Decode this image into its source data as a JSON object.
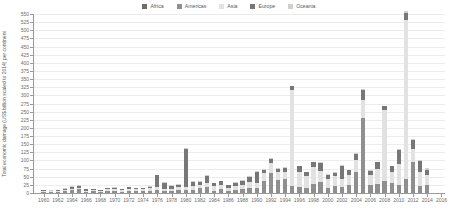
{
  "chart_data": {
    "type": "bar",
    "title": "",
    "subtitle": "",
    "xlabel": "",
    "ylabel": "Total economic damage (US$ billion scaled to 2014) per continent",
    "stacked": true,
    "grid": true,
    "legend_position": "top-center",
    "ylim": [
      0,
      550
    ],
    "ytick_step": 25,
    "ytick_labels": [
      "0",
      "25",
      "50",
      "75",
      "100",
      "125",
      "150",
      "175",
      "200",
      "225",
      "250",
      "275",
      "300",
      "325",
      "350",
      "375",
      "400",
      "425",
      "450",
      "475",
      "500",
      "525",
      "550"
    ],
    "xlim": [
      1959,
      2016
    ],
    "xtick_labels": [
      "1960",
      "1962",
      "1964",
      "1966",
      "1968",
      "1970",
      "1972",
      "1974",
      "1976",
      "1978",
      "1980",
      "1982",
      "1984",
      "1986",
      "1988",
      "1990",
      "1992",
      "1994",
      "1996",
      "1998",
      "2000",
      "2002",
      "2004",
      "2006",
      "2008",
      "2010",
      "2012",
      "2014",
      "2016"
    ],
    "categories": [
      1960,
      1961,
      1962,
      1963,
      1964,
      1965,
      1966,
      1967,
      1968,
      1969,
      1970,
      1971,
      1972,
      1973,
      1974,
      1975,
      1976,
      1977,
      1978,
      1979,
      1980,
      1981,
      1982,
      1983,
      1984,
      1985,
      1986,
      1987,
      1988,
      1989,
      1990,
      1991,
      1992,
      1993,
      1994,
      1995,
      1996,
      1997,
      1998,
      1999,
      2000,
      2001,
      2002,
      2003,
      2004,
      2005,
      2006,
      2007,
      2008,
      2009,
      2010,
      2011,
      2012,
      2013,
      2014
    ],
    "colors": {
      "Africa": "#6e6e6e",
      "Americas": "#8f8f8f",
      "Asia": "#e2e2e2",
      "Europe": "#777777",
      "Oceania": "#cfcfcf"
    },
    "series": [
      {
        "name": "Africa",
        "color": "#6e6e6e",
        "values": [
          0,
          0,
          0,
          0,
          0,
          0,
          0,
          0,
          0,
          0,
          0,
          0,
          0,
          0,
          0,
          0,
          0,
          0,
          0,
          0,
          0,
          0,
          0,
          0,
          0,
          0,
          0,
          0,
          0,
          0,
          0,
          0,
          0,
          0,
          0,
          0,
          0,
          0,
          0,
          0,
          0,
          0,
          0,
          0,
          0,
          0,
          0,
          0,
          0,
          0,
          0,
          0,
          0,
          0,
          0
        ]
      },
      {
        "name": "Americas",
        "color": "#8f8f8f",
        "values": [
          4,
          3,
          3,
          6,
          8,
          12,
          4,
          5,
          3,
          6,
          6,
          4,
          7,
          5,
          6,
          7,
          10,
          6,
          5,
          8,
          8,
          9,
          14,
          18,
          7,
          12,
          6,
          9,
          12,
          16,
          14,
          38,
          62,
          40,
          42,
          22,
          18,
          16,
          28,
          34,
          16,
          22,
          18,
          24,
          64,
          232,
          26,
          28,
          36,
          30,
          26,
          42,
          96,
          22,
          26
        ]
      },
      {
        "name": "Asia",
        "color": "#e2e2e2",
        "values": [
          2,
          2,
          3,
          4,
          5,
          4,
          3,
          4,
          3,
          5,
          6,
          5,
          6,
          6,
          5,
          8,
          10,
          6,
          8,
          10,
          12,
          14,
          10,
          12,
          14,
          12,
          10,
          14,
          12,
          18,
          16,
          22,
          30,
          24,
          24,
          296,
          48,
          36,
          52,
          34,
          26,
          30,
          26,
          32,
          38,
          54,
          28,
          46,
          218,
          36,
          62,
          490,
          40,
          44,
          28
        ]
      },
      {
        "name": "Europe",
        "color": "#777777",
        "values": [
          2,
          2,
          3,
          3,
          6,
          7,
          4,
          3,
          2,
          4,
          4,
          3,
          5,
          4,
          3,
          5,
          34,
          20,
          10,
          8,
          116,
          12,
          10,
          22,
          9,
          12,
          8,
          9,
          14,
          16,
          36,
          12,
          14,
          10,
          12,
          10,
          16,
          12,
          14,
          24,
          14,
          10,
          40,
          14,
          18,
          32,
          14,
          20,
          12,
          16,
          44,
          20,
          26,
          32,
          18
        ]
      },
      {
        "name": "Oceania",
        "color": "#cfcfcf",
        "values": [
          1,
          1,
          1,
          1,
          2,
          2,
          1,
          1,
          1,
          1,
          2,
          1,
          2,
          1,
          1,
          2,
          2,
          1,
          2,
          2,
          2,
          2,
          2,
          2,
          2,
          2,
          2,
          2,
          2,
          2,
          2,
          2,
          2,
          2,
          2,
          2,
          2,
          2,
          2,
          2,
          2,
          2,
          2,
          2,
          2,
          2,
          2,
          2,
          2,
          2,
          4,
          8,
          4,
          4,
          4
        ]
      }
    ]
  },
  "legend": {
    "items": [
      {
        "label": "Africa",
        "color": "#6e6e6e"
      },
      {
        "label": "Americas",
        "color": "#8f8f8f"
      },
      {
        "label": "Asia",
        "color": "#e2e2e2"
      },
      {
        "label": "Europe",
        "color": "#777777"
      },
      {
        "label": "Oceania",
        "color": "#cfcfcf"
      }
    ]
  }
}
